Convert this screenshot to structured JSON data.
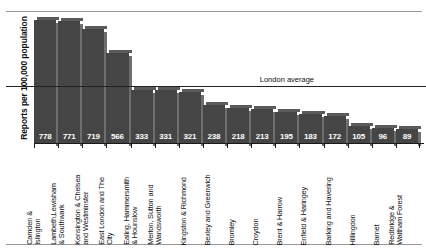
{
  "chart_data": {
    "type": "bar",
    "title": "",
    "xlabel": "",
    "ylabel": "Reports per 100,000 population",
    "ylim": [
      0,
      800
    ],
    "grid": false,
    "legend": "none",
    "orientation": "vertical",
    "bar_color": "#454545",
    "value_label_color": "#ffffff",
    "categories": [
      "Camden & Islington",
      "Lambeth,Lewisham & Southwark",
      "Kensington & Chelsea and Westminster",
      "East London and The City",
      "Ealing, Hammersmith & Hounslow",
      "Merton, Sutton and Wandsworth",
      "Kingston & Richmond",
      "Bexley and Greenwich",
      "Bromley",
      "Croydon",
      "Brent & Harrow",
      "Enfield & Haringey",
      "Barking and Havering",
      "Hillingdon",
      "Barnet",
      "Redbridge & Waltham Forest"
    ],
    "category_lines": [
      [
        "Camden &",
        "Islington"
      ],
      [
        "Lambeth,Lewisham",
        "& Southwark"
      ],
      [
        "Kensington & Chelsea",
        "and Westminster"
      ],
      [
        "East London and The",
        "City"
      ],
      [
        "Ealing, Hammersmith",
        "& Hounslow"
      ],
      [
        "Merton, Sutton and",
        "Wandsworth"
      ],
      [
        "Kingston & Richmond"
      ],
      [
        "Bexley and Greenwich"
      ],
      [
        "Bromley"
      ],
      [
        "Croydon"
      ],
      [
        "Brent & Harrow"
      ],
      [
        "Enfield & Haringey"
      ],
      [
        "Barking and Havering"
      ],
      [
        "Hillingdon"
      ],
      [
        "Barnet"
      ],
      [
        "Redbridge &",
        "Waltham Forest"
      ]
    ],
    "values": [
      778,
      771,
      719,
      566,
      333,
      331,
      321,
      238,
      218,
      213,
      195,
      183,
      172,
      105,
      96,
      89
    ],
    "annotations": [
      {
        "name": "london-average",
        "label": "London average",
        "value": 355,
        "style": "horizontal-reference-line"
      }
    ]
  },
  "axis": {
    "y_title": "Reports per 100,000 population"
  },
  "reference": {
    "label": "London average"
  }
}
